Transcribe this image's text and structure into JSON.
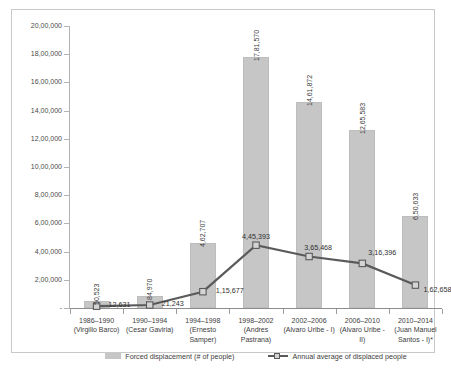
{
  "chart_data": {
    "type": "bar",
    "title": "",
    "subtitle": "",
    "xlabel": "",
    "ylabel": "",
    "grid": false,
    "legend_position": "bottom",
    "categories": [
      "1986–1990\n(Virgilio Barco)",
      "1990–1994\n(Cesar Gaviria)",
      "1994–1998\n(Ernesto Samper)",
      "1998–2002\n(Andres Pastrana)",
      "2002–2006\n(Alvaro Uribe - I)",
      "2006–2010\n(Alvaro Uribe - II)",
      "2010–2014\n(Juan Manuel Santos - I)*"
    ],
    "ylim": [
      0,
      2000000
    ],
    "ytick_values": [
      0,
      200000,
      400000,
      600000,
      800000,
      1000000,
      1200000,
      1400000,
      1600000,
      1800000,
      2000000
    ],
    "ytick_labels": [
      "-",
      "2,00,000",
      "4,00,000",
      "6,00,000",
      "8,00,000",
      "10,00,000",
      "12,00,000",
      "14,00,000",
      "16,00,000",
      "18,00,000",
      "20,00,000"
    ],
    "series": [
      {
        "name": "Forced displacement (# of people)",
        "type": "bar",
        "color": "#c6c6c6",
        "values": [
          50523,
          84970,
          462707,
          1781570,
          1461872,
          1265583,
          650633
        ],
        "labels": [
          "50,523",
          "84,970",
          "4,62,707",
          "17,81,570",
          "14,61,872",
          "12,65,583",
          "6,50,633"
        ]
      },
      {
        "name": "Annual average of displaced people",
        "type": "line",
        "color": "#5a5a5a",
        "values": [
          12631,
          21243,
          115677,
          445393,
          365468,
          316396,
          162658
        ],
        "labels": [
          "12,631",
          "21,243",
          "1,15,677",
          "4,45,393",
          "3,65,468",
          "3,16,396",
          "1,62,658"
        ]
      }
    ]
  },
  "legend": {
    "items": [
      {
        "label": "Forced displacement (# of people)",
        "marker": "bar-swatch"
      },
      {
        "label": "Annual average of displaced people",
        "marker": "line-marker-swatch"
      }
    ]
  },
  "colors": {
    "bar_fill": "#c6c6c6",
    "line_stroke": "#5a5a5a",
    "marker_fill": "#d4d4d4",
    "axis": "#b3b3b3",
    "text": "#3c3c3c",
    "frame": "#c9c9c9",
    "background": "#ffffff"
  }
}
